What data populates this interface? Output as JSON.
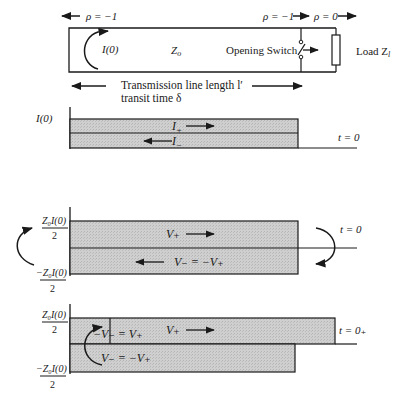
{
  "circuit": {
    "rho_left": "ρ = −1",
    "rho_switch": "ρ = −1",
    "rho_load": "ρ = 0",
    "current_label": "I(0)",
    "impedance_label": "Z",
    "impedance_sub": "o",
    "switch_label": "Opening Switch",
    "load_label": "Load Z",
    "load_sub": "l",
    "length_label": "Transmission line length l′",
    "transit_label": "transit time δ"
  },
  "panel_current": {
    "axis_label": "I(0)",
    "forward_wave": "I",
    "forward_sub": "+",
    "backward_wave": "I",
    "backward_sub": "−",
    "time_label": "t = 0"
  },
  "panel_voltage_t0": {
    "upper_label_num": "Z₀I(0)",
    "upper_label_den": "2",
    "lower_label_num": "−Z₀I(0)",
    "lower_label_den": "2",
    "forward_wave": "V₊",
    "backward_wave": "V₋ = −V₊",
    "time_label": "t = 0"
  },
  "panel_voltage_t0plus": {
    "upper_label_num": "Z₀I(0)",
    "upper_label_den": "2",
    "lower_label_num": "−Z₀I(0)",
    "lower_label_den": "2",
    "reflected_wave": "−V₋ = V₊",
    "forward_wave": "V₊",
    "backward_wave": "V₋ = −V₊",
    "time_label": "t = 0₊"
  },
  "colors": {
    "fill": "#c9c9c9",
    "line": "#1a1a1a"
  }
}
